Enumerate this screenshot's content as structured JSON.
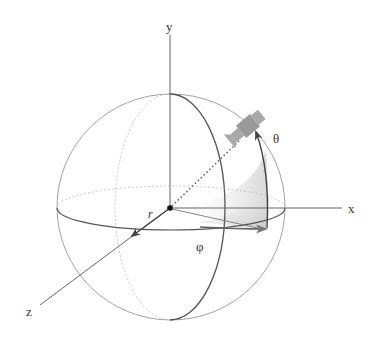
{
  "diagram": {
    "labels": {
      "x_axis": "x",
      "y_axis": "y",
      "z_axis": "z",
      "radius": "r",
      "theta": "θ",
      "phi": "φ"
    },
    "elements": [
      "sphere",
      "equator-ellipse",
      "meridian-ellipse",
      "x-axis",
      "y-axis",
      "z-axis",
      "origin-point",
      "radius-vector-dotted",
      "satellite",
      "theta-arc-arrow",
      "phi-arc-arrow",
      "shaded-sector"
    ],
    "colors": {
      "line": "#555555",
      "thin_line": "#888888",
      "satellite": "#9a9a9a",
      "shade": "#bbbbbb",
      "background": "#ffffff"
    }
  }
}
